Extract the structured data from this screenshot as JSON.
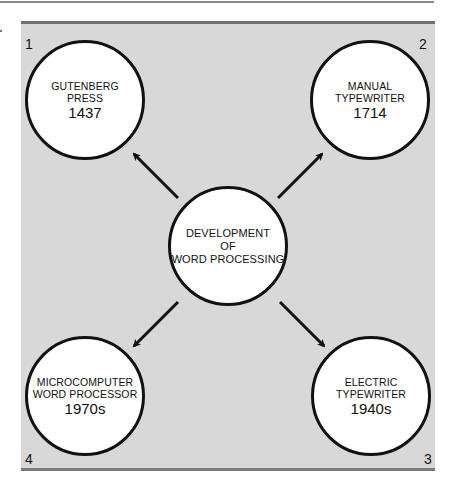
{
  "diagram": {
    "center": {
      "lines": [
        "DEVELOPMENT",
        "OF",
        "WORD PROCESSING"
      ]
    },
    "nodes": [
      {
        "number": "1",
        "lines": [
          "GUTENBERG",
          "PRESS"
        ],
        "year": "1437",
        "position": "top-left"
      },
      {
        "number": "2",
        "lines": [
          "MANUAL",
          "TYPEWRITER"
        ],
        "year": "1714",
        "position": "top-right"
      },
      {
        "number": "3",
        "lines": [
          "ELECTRIC",
          "TYPEWRITER"
        ],
        "year": "1940s",
        "position": "bottom-right"
      },
      {
        "number": "4",
        "lines": [
          "MICROCOMPUTER",
          "WORD PROCESSOR"
        ],
        "year": "1970s",
        "position": "bottom-left"
      }
    ],
    "colors": {
      "panel": "#d8d8d8",
      "circle_fill": "#ffffff",
      "stroke": "#111111"
    }
  }
}
